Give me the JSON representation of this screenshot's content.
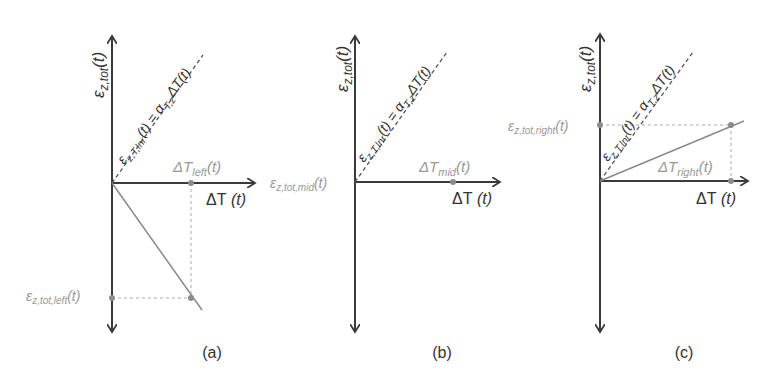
{
  "panels": [
    {
      "id": "a",
      "caption": "(a)",
      "y_axis_label": {
        "main": "ε",
        "sub": "z,tot",
        "arg": "(t)"
      },
      "x_axis_label": {
        "main": "ΔT",
        "arg": " (t)"
      },
      "reference_line_label": {
        "lhs_main": "ε",
        "lhs_sub": "z,T,lnr",
        "lhs_arg": "(t) = ",
        "rhs_main": "α",
        "rhs_sub": "T,z",
        "rhs_arg": "ΔT(t)"
      },
      "point_x_label": {
        "main": "ΔT",
        "sub": "left",
        "arg": "(t)"
      },
      "point_y_label": {
        "main": "ε",
        "sub": "z,tot,left",
        "arg": "(t)"
      },
      "behavior": "negative slope"
    },
    {
      "id": "b",
      "caption": "(b)",
      "y_axis_label": {
        "main": "ε",
        "sub": "z,tot",
        "arg": "(t)"
      },
      "x_axis_label": {
        "main": "ΔT",
        "arg": " (t)"
      },
      "reference_line_label": {
        "lhs_main": "ε",
        "lhs_sub": "z,T,lnr",
        "lhs_arg": "(t) = ",
        "rhs_main": "α",
        "rhs_sub": "T,z",
        "rhs_arg": "ΔT(t)"
      },
      "point_x_label": {
        "main": "ΔT",
        "sub": "mid",
        "arg": "(t)"
      },
      "point_y_label": {
        "main": "ε",
        "sub": "z,tot,mid",
        "arg": "(t)"
      },
      "behavior": "zero slope"
    },
    {
      "id": "c",
      "caption": "(c)",
      "y_axis_label": {
        "main": "ε",
        "sub": "z,tot",
        "arg": "(t)"
      },
      "x_axis_label": {
        "main": "ΔT",
        "arg": " (t)"
      },
      "reference_line_label": {
        "lhs_main": "ε",
        "lhs_sub": "z,T,lnr",
        "lhs_arg": "(t) = ",
        "rhs_main": "α",
        "rhs_sub": "T,z",
        "rhs_arg": "ΔT(t)"
      },
      "point_x_label": {
        "main": "ΔT",
        "sub": "right",
        "arg": "(t)"
      },
      "point_y_label": {
        "main": "ε",
        "sub": "z,tot,right",
        "arg": "(t)"
      },
      "behavior": "positive slope less than reference"
    }
  ],
  "colors": {
    "axis": "#3a3a3a",
    "reference_dashed": "#555555",
    "response_line": "#8a8a8a",
    "guide": "#aaaaaa",
    "label_gray": "#999999"
  }
}
